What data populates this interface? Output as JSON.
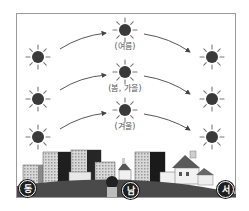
{
  "diagram": {
    "type": "sun-path-by-season",
    "season_labels": {
      "summer": "(여름)",
      "spring_autumn": "(봄, 가을)",
      "winter": "(겨울)"
    },
    "compass": {
      "east": "동",
      "south": "남",
      "west": "서"
    },
    "paths": [
      {
        "season": "summer",
        "rise": [
          38,
          57
        ],
        "noon": [
          125,
          30
        ],
        "set": [
          212,
          57
        ]
      },
      {
        "season": "spring_autumn",
        "rise": [
          38,
          99
        ],
        "noon": [
          125,
          72
        ],
        "set": [
          212,
          99
        ]
      },
      {
        "season": "winter",
        "rise": [
          38,
          137
        ],
        "noon": [
          125,
          110
        ],
        "set": [
          212,
          137
        ]
      }
    ],
    "colors": {
      "sun": "#3a3a3a",
      "ground": "#4a4a4a",
      "frame": "#9a9a9a",
      "arrow": "#444444"
    }
  }
}
